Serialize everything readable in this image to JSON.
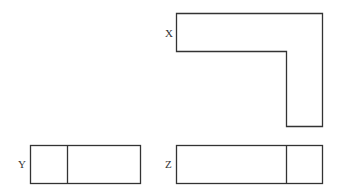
{
  "diagram": {
    "shapes": [
      {
        "id": "X",
        "label": "X",
        "kind": "L-shape"
      },
      {
        "id": "Y",
        "label": "Y",
        "kind": "rectangle-divided"
      },
      {
        "id": "Z",
        "label": "Z",
        "kind": "rectangle-divided"
      }
    ],
    "stroke_color": "#333333",
    "background": "#ffffff"
  }
}
